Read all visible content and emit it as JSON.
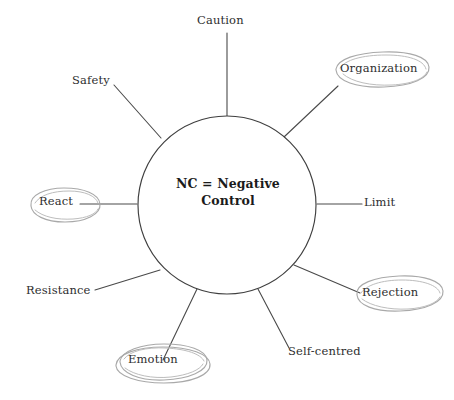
{
  "diagram": {
    "type": "spoke-wheel",
    "title": "",
    "hub": {
      "line1": "NC = Negative",
      "line2": "Control",
      "full_text": "NC = Negative Control",
      "center_x": 227,
      "center_y": 205,
      "radius": 89,
      "stroke_color": "#3f3f3f",
      "fill_color": "#ffffff"
    },
    "colors": {
      "background": "#ffffff",
      "line": "#4a4a4a",
      "text": "#2e2e2e",
      "hub_text": "#1b1b1b",
      "pencil_annotation": "#a9a9a9"
    },
    "spokes": [
      {
        "id": "caution",
        "label": "Caution",
        "angle_deg": 90,
        "highlighted": false,
        "annotation": "none"
      },
      {
        "id": "organization",
        "label": "Organization",
        "angle_deg": 50,
        "highlighted": true,
        "annotation": "hand-drawn-ellipse"
      },
      {
        "id": "limit",
        "label": "Limit",
        "angle_deg": 0,
        "highlighted": false,
        "annotation": "none"
      },
      {
        "id": "rejection",
        "label": "Rejection",
        "angle_deg": -42,
        "highlighted": true,
        "annotation": "hand-drawn-ellipse"
      },
      {
        "id": "self-centred",
        "label": "Self-centred",
        "angle_deg": -70,
        "highlighted": false,
        "annotation": "none"
      },
      {
        "id": "emotion",
        "label": "Emotion",
        "angle_deg": -110,
        "highlighted": true,
        "annotation": "hand-drawn-ellipse"
      },
      {
        "id": "resistance",
        "label": "Resistance",
        "angle_deg": -140,
        "highlighted": false,
        "annotation": "none"
      },
      {
        "id": "react",
        "label": "React",
        "angle_deg": 180,
        "highlighted": true,
        "annotation": "hand-drawn-ellipse"
      },
      {
        "id": "safety",
        "label": "Safety",
        "angle_deg": 137,
        "highlighted": false,
        "annotation": "none"
      }
    ]
  }
}
